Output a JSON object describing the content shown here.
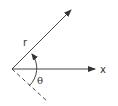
{
  "diagram": {
    "type": "polar-angle-diagram",
    "labels": {
      "radius": "r",
      "angle": "θ",
      "axis": "x"
    },
    "colors": {
      "stroke": "#333333",
      "background": "#ffffff"
    }
  }
}
